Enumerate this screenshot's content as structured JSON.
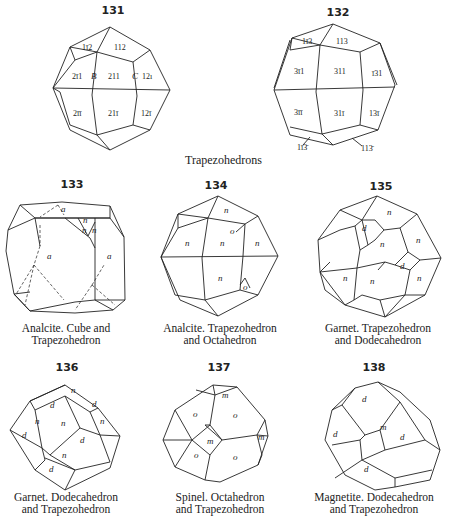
{
  "figures": [
    {
      "number": "131",
      "faces": [
        "1̅2",
        "112",
        "2̅1",
        "211",
        "1̅2̅",
        "2̅1̅",
        "21̅",
        "12̅",
        "B",
        "C"
      ],
      "caption": ""
    },
    {
      "number": "132",
      "faces": [
        "1̅3",
        "113",
        "3̅1",
        "311",
        "1̃1",
        "3̅1̅",
        "31̅",
        "13̅",
        "1̅3̅",
        "113̅"
      ],
      "caption": ""
    },
    {
      "number": "133",
      "faces": [
        "a",
        "n",
        "n",
        "n",
        "a",
        "a"
      ],
      "caption": "Analcite.   Cube and\nTrapezohedron"
    },
    {
      "number": "134",
      "faces": [
        "n",
        "n",
        "n",
        "n",
        "n",
        "o",
        "o"
      ],
      "caption": "Analcite.   Trapezohedron\nand Octahedron"
    },
    {
      "number": "135",
      "faces": [
        "n",
        "d",
        "n",
        "n",
        "d",
        "n",
        "n",
        "n"
      ],
      "caption": "Garnet.   Trapezohedron\nand Dodecahedron"
    },
    {
      "number": "136",
      "faces": [
        "d",
        "n",
        "d",
        "n",
        "n",
        "n",
        "d",
        "d",
        "n",
        "d"
      ],
      "caption": "Garnet.   Dodecahedron\nand Trapezohedron"
    },
    {
      "number": "137",
      "faces": [
        "m",
        "o",
        "o",
        "m",
        "m",
        "o",
        "o"
      ],
      "caption": "Spinel.   Octahedron\nand Trapezohedron"
    },
    {
      "number": "138",
      "faces": [
        "d",
        "m",
        "d",
        "d",
        "d"
      ],
      "caption": "Magnetite.   Dodecahedron\nand Trapezohedron"
    }
  ],
  "labels": {
    "f131": {
      "l1": "1ī2",
      "l2": "112",
      "l3": "2ī1",
      "l4": "B",
      "l5": "211",
      "l6": "C",
      "l7": "12ı",
      "l8": "2īī",
      "l9": "21ī",
      "l10": "12ī"
    },
    "f132": {
      "l1": "1ī3",
      "l2": "113",
      "l3": "3ī1",
      "l4": "311",
      "l5": "ī31",
      "l6": "3īī",
      "l7": "31ī",
      "l8": "13ī",
      "l9": "1ī3̄",
      "l10": "113̄"
    },
    "f133": {
      "a1": "a",
      "n1": "n",
      "n2": "n",
      "n3": "n",
      "a2": "a",
      "a3": "a"
    },
    "f134": {
      "n1": "n",
      "n2": "n",
      "n3": "n",
      "n4": "n",
      "n5": "n",
      "o1": "o",
      "o2": "o"
    },
    "f135": {
      "n1": "n",
      "d1": "d",
      "n2": "n",
      "n3": "n",
      "d2": "d",
      "n4": "n",
      "n5": "n",
      "n6": "n"
    },
    "f136": {
      "d1": "d",
      "n1": "n",
      "d2": "d",
      "n2": "n",
      "n3": "n",
      "n4": "n",
      "d3": "d",
      "d4": "d",
      "n5": "n",
      "d5": "d"
    },
    "f137": {
      "m1": "m",
      "o1": "o",
      "o2": "o",
      "m2": "m",
      "m3": "m",
      "o3": "o",
      "o4": "o"
    },
    "f138": {
      "d1": "d",
      "d2": "d",
      "m1": "m",
      "d3": "d",
      "d4": "d"
    }
  },
  "group_title": "Trapezohedrons"
}
